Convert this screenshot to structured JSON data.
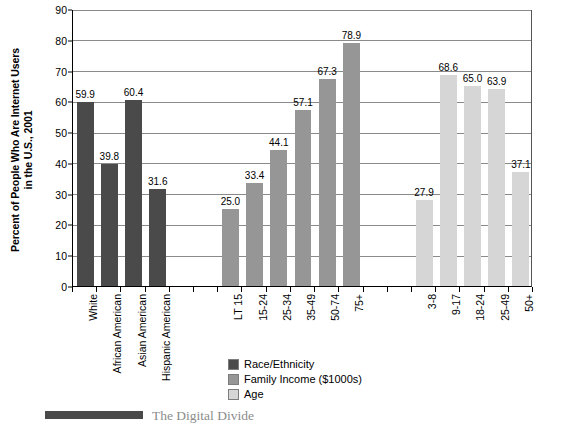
{
  "chart_data": {
    "type": "bar",
    "title": "",
    "xlabel": "",
    "ylabel": "Percent of People Who Are Internet Users in the U.S., 2001",
    "ylabel_lines": [
      "Percent of People Who Are Internet Users",
      "in the U.S., 2001"
    ],
    "ylim": [
      0,
      90
    ],
    "ytick_step": 10,
    "ytick_labels": [
      "0",
      "10",
      "20",
      "30",
      "40",
      "50",
      "60",
      "70",
      "80",
      "90"
    ],
    "grid": true,
    "grid_axis": "y",
    "legend_position": "bottom-center",
    "groups": [
      {
        "name": "Race/Ethnicity",
        "color": "#4a4a4a",
        "categories": [
          "White",
          "African American",
          "Asian American",
          "Hispanic American"
        ],
        "values": [
          59.9,
          39.8,
          60.4,
          31.6
        ],
        "value_labels": [
          "59.9",
          "39.8",
          "60.4",
          "31.6"
        ]
      },
      {
        "name": "Family Income ($1000s)",
        "color": "#969696",
        "categories": [
          "LT 15",
          "15-24",
          "25-34",
          "35-49",
          "50-74",
          "75+"
        ],
        "values": [
          25.0,
          33.4,
          44.1,
          57.1,
          67.3,
          78.9
        ],
        "value_labels": [
          "25.0",
          "33.4",
          "44.1",
          "57.1",
          "67.3",
          "78.9"
        ]
      },
      {
        "name": "Age",
        "color": "#d6d6d6",
        "categories": [
          "3-8",
          "9-17",
          "18-24",
          "25-49",
          "50+"
        ],
        "values": [
          27.9,
          68.6,
          65.0,
          63.9,
          37.1
        ],
        "value_labels": [
          "27.9",
          "68.6",
          "65.0",
          "63.9",
          "37.1"
        ]
      }
    ],
    "legend": [
      {
        "label": "Race/Ethnicity",
        "color": "#4a4a4a"
      },
      {
        "label": "Family Income ($1000s)",
        "color": "#969696"
      },
      {
        "label": "Age",
        "color": "#d6d6d6"
      }
    ]
  },
  "caption": {
    "text": "The Digital Divide",
    "marker": "H"
  }
}
